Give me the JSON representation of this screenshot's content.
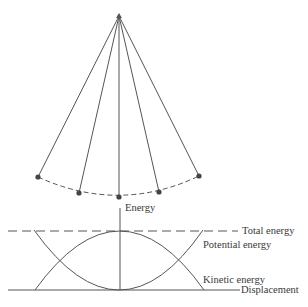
{
  "diagram": {
    "colors": {
      "line": "#555555",
      "bob": "#444444",
      "text": "#3a3a3a"
    },
    "pendulum": {
      "pivot": {
        "x": 119,
        "y": 16
      },
      "bobs": [
        {
          "x": 38,
          "y": 177
        },
        {
          "x": 79,
          "y": 193
        },
        {
          "x": 119,
          "y": 197
        },
        {
          "x": 159,
          "y": 192
        },
        {
          "x": 199,
          "y": 176
        }
      ]
    },
    "energy_plot": {
      "axis_label_y": "Energy",
      "axis_label_x": "Displacement",
      "total_energy_label": "Total energy",
      "potential_energy_label": "Potential energy",
      "kinetic_energy_label": "Kinetic energy"
    }
  }
}
